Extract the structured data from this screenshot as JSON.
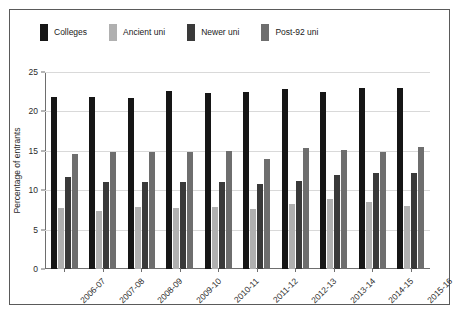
{
  "chart_data": {
    "type": "bar",
    "title": "",
    "xlabel": "",
    "ylabel": "Percentage of entrants",
    "ylim": [
      0,
      25
    ],
    "yticks": [
      0,
      5,
      10,
      15,
      20,
      25
    ],
    "grid": true,
    "legend_position": "top",
    "categories": [
      "2006-07",
      "2007-08",
      "2008-09",
      "2009-10",
      "2010-11",
      "2011-12",
      "2012-13",
      "2013-14",
      "2014-15",
      "2015-16"
    ],
    "series": [
      {
        "name": "Colleges",
        "color": "#161616",
        "values": [
          21.8,
          21.8,
          21.7,
          22.6,
          22.3,
          22.5,
          22.9,
          22.5,
          23.0,
          23.0
        ]
      },
      {
        "name": "Ancient uni",
        "color": "#b0b0b0",
        "values": [
          7.7,
          7.3,
          7.9,
          7.7,
          7.9,
          7.6,
          8.2,
          8.9,
          8.5,
          8.0
        ]
      },
      {
        "name": "Newer uni",
        "color": "#3a3a3a",
        "values": [
          11.7,
          11.1,
          11.0,
          11.0,
          11.1,
          10.8,
          11.2,
          11.9,
          12.2,
          12.2
        ]
      },
      {
        "name": "Post-92 uni",
        "color": "#6e6e6e",
        "values": [
          14.6,
          14.9,
          14.8,
          14.8,
          15.0,
          14.0,
          15.4,
          15.1,
          14.8,
          15.5
        ]
      }
    ]
  },
  "legend": {
    "entries": [
      {
        "label": "Colleges"
      },
      {
        "label": "Ancient uni"
      },
      {
        "label": "Newer uni"
      },
      {
        "label": "Post-92 uni"
      }
    ]
  }
}
